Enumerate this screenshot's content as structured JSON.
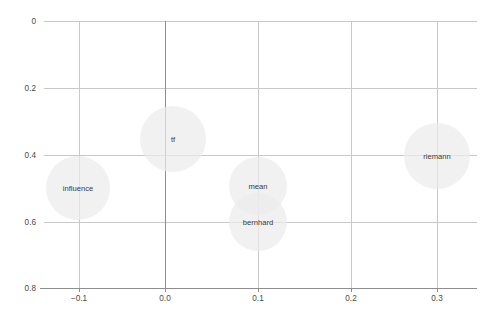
{
  "chart_data": {
    "type": "scatter",
    "title": "",
    "subtitle": "",
    "xlabel": "",
    "ylabel": "",
    "xlim": [
      -0.1464,
      0.3535
    ],
    "ylim": [
      0.0,
      0.8
    ],
    "grid": true,
    "legend": false,
    "legend_position": "none",
    "bubble_fill": "#ebebeb",
    "bubble_opacity": 0.72,
    "gridline_color": "#c9c9c9",
    "axis_color": "#8e8e8e",
    "label_color": "#3b3b3b",
    "tick_color": "#4a4a4a",
    "xticks": [
      -0.1,
      0.0,
      0.1,
      0.2,
      0.3
    ],
    "xticklabels": [
      "−0.1",
      "0.0",
      "0.1",
      "0.2",
      "0.3"
    ],
    "yticks": [
      0,
      0.2,
      0.4,
      0.6,
      0.8
    ],
    "yticklabels": [
      "0",
      "0.2",
      "0.4",
      "0.6",
      "0.8"
    ],
    "points": [
      {
        "label": "influence",
        "x": -0.1,
        "y": 0.3,
        "r": 32,
        "cx": 78,
        "cy": 188
      },
      {
        "label": "tf",
        "x": 0.009,
        "y": 0.445,
        "r": 33,
        "cx": 173,
        "cy": 139
      },
      {
        "label": "mean",
        "x": 0.1,
        "y": 0.305,
        "r": 29,
        "cx": 258,
        "cy": 186
      },
      {
        "label": "bernhard",
        "x": 0.1,
        "y": 0.2,
        "r": 29,
        "cx": 258,
        "cy": 222
      },
      {
        "label": "riemann",
        "x": 0.3,
        "y": 0.395,
        "r": 33,
        "cx": 437,
        "cy": 156
      }
    ]
  },
  "geometry": {
    "plot_left": 44,
    "plot_right": 477,
    "plot_top": 21,
    "plot_bottom": 288,
    "axis_bottom_left": 40,
    "zero_x_px": 165,
    "xgrid_px": [
      79,
      165,
      258,
      351,
      437
    ],
    "ygrid_px": [
      21,
      88,
      155,
      222,
      288
    ],
    "ylabel_x": 36,
    "xlabel_y": 301
  }
}
